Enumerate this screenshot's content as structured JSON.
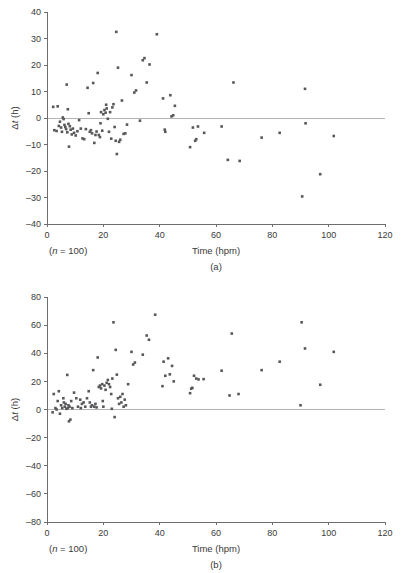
{
  "figure": {
    "kind": "two-panel-scatter",
    "marker_color": "#58585b",
    "axis_color": "#6e6e6e",
    "zero_line_color": "#b4b4b4"
  },
  "chart_data": [
    {
      "type": "scatter",
      "panel": "(a)",
      "title": "",
      "xlabel": "Time (hpm)",
      "ylabel": "Δt (h)",
      "ylabel_prefix": "Δ",
      "ylabel_italic": "t",
      "ylabel_suffix": " (h)",
      "note": "(n = 100)",
      "note_prefix": "(",
      "note_italic": "n",
      "note_suffix": " = 100)",
      "xlim": [
        0,
        120
      ],
      "ylim": [
        -40,
        40
      ],
      "xticks": [
        0,
        20,
        40,
        60,
        80,
        100,
        120
      ],
      "yticks": [
        -40,
        -30,
        -20,
        -10,
        0,
        10,
        20,
        30,
        40
      ],
      "grid": false,
      "legend": "none",
      "zero_line": 0,
      "n": 100,
      "points": [
        [
          2.2,
          4.2
        ],
        [
          2.6,
          -4.6
        ],
        [
          3.4,
          -4.9
        ],
        [
          3.8,
          4.4
        ],
        [
          4.2,
          -3.0
        ],
        [
          4.6,
          -1.4
        ],
        [
          5.0,
          -3.6
        ],
        [
          5.3,
          -5.2
        ],
        [
          5.6,
          0.2
        ],
        [
          5.9,
          -0.4
        ],
        [
          6.2,
          -2.6
        ],
        [
          6.5,
          -3.4
        ],
        [
          6.8,
          -4.2
        ],
        [
          7.0,
          12.6
        ],
        [
          7.2,
          -5.4
        ],
        [
          7.4,
          3.3
        ],
        [
          7.6,
          -2.2
        ],
        [
          7.8,
          -10.8
        ],
        [
          8.1,
          -3.1
        ],
        [
          8.4,
          -4.4
        ],
        [
          8.8,
          -6.2
        ],
        [
          9.2,
          -4.0
        ],
        [
          9.6,
          -5.6
        ],
        [
          10.2,
          -6.6
        ],
        [
          10.8,
          -5.0
        ],
        [
          11.4,
          -0.8
        ],
        [
          12.0,
          -4.0
        ],
        [
          12.6,
          -7.7
        ],
        [
          13.2,
          -8.0
        ],
        [
          13.8,
          -4.2
        ],
        [
          14.4,
          11.4
        ],
        [
          14.8,
          1.8
        ],
        [
          15.2,
          -5.2
        ],
        [
          15.6,
          -4.6
        ],
        [
          16.0,
          -5.8
        ],
        [
          16.4,
          13.2
        ],
        [
          16.8,
          -9.4
        ],
        [
          17.2,
          -6.4
        ],
        [
          17.6,
          -5.1
        ],
        [
          18.0,
          17.0
        ],
        [
          18.4,
          -6.4
        ],
        [
          18.8,
          -7.2
        ],
        [
          19.2,
          2.2
        ],
        [
          19.6,
          -4.8
        ],
        [
          20.0,
          1.4
        ],
        [
          20.4,
          3.0
        ],
        [
          20.8,
          2.0
        ],
        [
          21.2,
          3.6
        ],
        [
          21.6,
          -0.3
        ],
        [
          22.0,
          -5.2
        ],
        [
          22.4,
          2.2
        ],
        [
          22.8,
          -7.8
        ],
        [
          23.2,
          4.0
        ],
        [
          23.6,
          5.2
        ],
        [
          24.0,
          -3.4
        ],
        [
          24.4,
          -8.6
        ],
        [
          24.6,
          32.5
        ],
        [
          24.8,
          -13.6
        ],
        [
          25.2,
          19.0
        ],
        [
          25.6,
          -9.0
        ],
        [
          26.0,
          -8.2
        ],
        [
          26.6,
          6.6
        ],
        [
          27.2,
          -6.0
        ],
        [
          27.8,
          -5.8
        ],
        [
          28.4,
          -2.5
        ],
        [
          30.0,
          16.2
        ],
        [
          31.0,
          9.6
        ],
        [
          31.6,
          10.4
        ],
        [
          34.0,
          21.8
        ],
        [
          34.6,
          22.6
        ],
        [
          35.4,
          13.4
        ],
        [
          36.4,
          20.2
        ],
        [
          39.0,
          31.6
        ],
        [
          41.2,
          7.4
        ],
        [
          41.8,
          -4.4
        ],
        [
          42.0,
          -5.2
        ],
        [
          43.8,
          8.6
        ],
        [
          44.2,
          0.6
        ],
        [
          44.8,
          1.0
        ],
        [
          45.4,
          4.6
        ],
        [
          50.8,
          -11.0
        ],
        [
          51.8,
          -3.6
        ],
        [
          52.6,
          -8.6
        ],
        [
          53.0,
          -8.0
        ],
        [
          53.6,
          -3.2
        ],
        [
          55.8,
          -5.6
        ],
        [
          62.0,
          -3.2
        ],
        [
          64.2,
          -15.8
        ],
        [
          66.2,
          13.4
        ],
        [
          68.4,
          -16.2
        ],
        [
          76.2,
          -7.4
        ],
        [
          82.6,
          -5.6
        ],
        [
          90.6,
          -29.6
        ],
        [
          91.6,
          11.0
        ],
        [
          91.8,
          -2.0
        ],
        [
          97.0,
          -21.2
        ],
        [
          101.8,
          -6.8
        ],
        [
          19.0,
          -2.0
        ],
        [
          21.0,
          5.0
        ],
        [
          33.0,
          -1.0
        ]
      ]
    },
    {
      "type": "scatter",
      "panel": "(b)",
      "title": "",
      "xlabel": "Time (hpm)",
      "ylabel": "Δt (h)",
      "ylabel_prefix": "Δ",
      "ylabel_italic": "t",
      "ylabel_suffix": " (h)",
      "note": "(n = 100)",
      "note_prefix": "(",
      "note_italic": "n",
      "note_suffix": " = 100)",
      "xlim": [
        0,
        120
      ],
      "ylim": [
        -80,
        80
      ],
      "xticks": [
        0,
        20,
        40,
        60,
        80,
        100,
        120
      ],
      "yticks": [
        -80,
        -60,
        -40,
        -20,
        0,
        20,
        40,
        60,
        80
      ],
      "grid": false,
      "legend": "none",
      "zero_line": 0,
      "n": 100,
      "points": [
        [
          2.0,
          -2.0
        ],
        [
          2.4,
          11.0
        ],
        [
          3.0,
          1.0
        ],
        [
          3.4,
          0.0
        ],
        [
          3.8,
          6.0
        ],
        [
          4.2,
          13.0
        ],
        [
          4.6,
          -3.0
        ],
        [
          5.0,
          3.0
        ],
        [
          5.4,
          1.0
        ],
        [
          5.8,
          8.0
        ],
        [
          6.0,
          5.0
        ],
        [
          6.3,
          2.0
        ],
        [
          6.6,
          4.0
        ],
        [
          6.9,
          0.5
        ],
        [
          7.2,
          24.6
        ],
        [
          7.4,
          1.0
        ],
        [
          7.6,
          3.0
        ],
        [
          7.8,
          -8.4
        ],
        [
          8.0,
          2.0
        ],
        [
          8.3,
          -7.2
        ],
        [
          8.6,
          6.0
        ],
        [
          9.0,
          1.0
        ],
        [
          9.6,
          12.0
        ],
        [
          10.4,
          8.0
        ],
        [
          11.0,
          2.0
        ],
        [
          11.8,
          7.0
        ],
        [
          12.4,
          4.0
        ],
        [
          13.0,
          5.0
        ],
        [
          13.6,
          2.0
        ],
        [
          14.2,
          8.0
        ],
        [
          14.8,
          13.0
        ],
        [
          15.2,
          5.0
        ],
        [
          15.6,
          2.0
        ],
        [
          16.0,
          3.0
        ],
        [
          16.4,
          28.0
        ],
        [
          16.8,
          2.0
        ],
        [
          17.2,
          4.0
        ],
        [
          17.6,
          1.5
        ],
        [
          18.0,
          37.0
        ],
        [
          18.4,
          16.0
        ],
        [
          18.8,
          17.0
        ],
        [
          19.2,
          15.0
        ],
        [
          19.6,
          18.0
        ],
        [
          20.0,
          2.0
        ],
        [
          20.4,
          17.0
        ],
        [
          20.8,
          14.0
        ],
        [
          21.2,
          19.0
        ],
        [
          21.6,
          21.0
        ],
        [
          22.0,
          18.0
        ],
        [
          22.4,
          16.0
        ],
        [
          22.8,
          11.0
        ],
        [
          23.2,
          22.0
        ],
        [
          23.6,
          62.0
        ],
        [
          24.0,
          -5.4
        ],
        [
          24.4,
          42.4
        ],
        [
          24.8,
          24.8
        ],
        [
          25.2,
          8.0
        ],
        [
          25.6,
          4.0
        ],
        [
          26.0,
          9.0
        ],
        [
          26.4,
          5.0
        ],
        [
          26.8,
          11.0
        ],
        [
          27.2,
          2.0
        ],
        [
          27.6,
          7.0
        ],
        [
          28.0,
          3.0
        ],
        [
          30.0,
          41.0
        ],
        [
          30.6,
          32.0
        ],
        [
          31.2,
          33.4
        ],
        [
          34.0,
          39.0
        ],
        [
          35.4,
          52.6
        ],
        [
          36.2,
          49.6
        ],
        [
          38.4,
          67.4
        ],
        [
          41.0,
          16.6
        ],
        [
          41.4,
          34.0
        ],
        [
          42.0,
          24.0
        ],
        [
          43.0,
          36.4
        ],
        [
          43.6,
          25.0
        ],
        [
          44.4,
          31.0
        ],
        [
          50.8,
          11.6
        ],
        [
          51.2,
          14.8
        ],
        [
          51.6,
          15.4
        ],
        [
          52.2,
          24.0
        ],
        [
          53.0,
          22.0
        ],
        [
          53.8,
          21.4
        ],
        [
          55.6,
          21.6
        ],
        [
          62.0,
          27.6
        ],
        [
          64.8,
          10.0
        ],
        [
          65.6,
          54.0
        ],
        [
          68.0,
          11.0
        ],
        [
          76.2,
          28.0
        ],
        [
          82.6,
          34.0
        ],
        [
          90.0,
          3.0
        ],
        [
          90.4,
          62.0
        ],
        [
          91.6,
          43.4
        ],
        [
          97.0,
          17.6
        ],
        [
          101.8,
          41.0
        ],
        [
          12.0,
          1.0
        ],
        [
          19.8,
          6.0
        ],
        [
          23.0,
          0.5
        ],
        [
          45.0,
          20.0
        ],
        [
          28.8,
          18.0
        ]
      ]
    }
  ]
}
